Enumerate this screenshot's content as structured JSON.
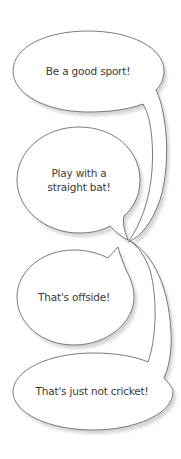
{
  "diagram": {
    "type": "speech-bubbles",
    "colors": {
      "background": "#ffffff",
      "bubble_fill": "#ffffff",
      "bubble_stroke": "#6b6b6b",
      "shadow": "#d6d6d6",
      "text": "#3a3a3a"
    },
    "bubbles": [
      {
        "lines": [
          "Be a good sport!"
        ]
      },
      {
        "lines": [
          "Play with a",
          "straight bat!"
        ]
      },
      {
        "lines": [
          "That's offside!"
        ]
      },
      {
        "lines": [
          "That's just not cricket!"
        ]
      }
    ]
  }
}
